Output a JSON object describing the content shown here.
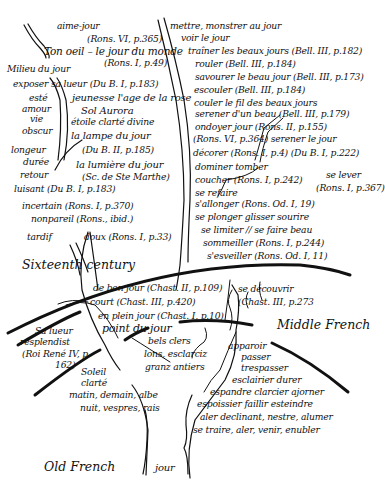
{
  "era_labels": {
    "sixteenth": "Sixteenth century",
    "middle": "Middle French",
    "old": "Old French"
  },
  "root": "jour",
  "sixteenth_left": [
    "aime-jour",
    "(Rons. VI, p.365)",
    "Ton oeil – le jour du monde",
    "(Rons. I, p.49)",
    "Milieu du jour",
    "exposer sa lueur (Du B. I, p.183)",
    "esté",
    "amour",
    "vie",
    "obscur",
    "longeur",
    "durée",
    "retour",
    "luisant (Du B. I, p.183)",
    "incertain (Rons. I, p.370)",
    "nonpareil (Rons., ibid.)",
    "tardif",
    "doux (Rons. I, p.33)"
  ],
  "sixteenth_center": [
    "jeunesse  l'age de la rose",
    "Sol    Aurora",
    "étoile  clarté divine",
    "la lampe du jour",
    "(Du B. II, p.185)",
    "la lumière du jour",
    "(Sc. de Ste Marthe)"
  ],
  "sixteenth_right": [
    "mettre, monstrer au jour",
    "voir le jour",
    "traîner les beaux jours (Bell. III, p.182)",
    "rouler (Bell. III, p.184)",
    "savourer le beau jour (Bell. III, p.173)",
    "escouler (Bell. III, p.184)",
    "couler le fil des beaux jours",
    "serener d'un beau        (Bell. III, p.179)",
    "ondoyer          jour (Rons. II, p.155)",
    "(Rons. VI, p.364)   serener le jour",
    "décorer (Rons. I, p.4)  (Du B. I, p.222)",
    "dominer tomber",
    "coucher (Rons. I, p.242)",
    "se refaire",
    "s'allonger (Rons. Od. I, 19)",
    "se plonger glisser sourire",
    "se limiter // se faire beau",
    "sommeiller (Rons. I, p.244)",
    "s'esveiller (Rons. Od. I, 11)"
  ],
  "se_lever": [
    "se lever",
    "(Rons. I, p.367)"
  ],
  "middle_center": [
    "de bon jour (Chast. II, p.109)",
    "court (Chast. III, p.420)",
    "en plein jour (Chast. I, p.10)",
    "point du jour"
  ],
  "middle_right": [
    "se découvrir",
    "(Chast. III, p.273"
  ],
  "middle_left": [
    "Sa lueur",
    "resplendist",
    "(Roi René IV, p.",
    "162)"
  ],
  "old_center_upper": [
    "bels clers",
    "lons, esclarciz",
    "granz antiers"
  ],
  "old_left": [
    "Soleil",
    "clarté",
    "matin, demain, albe",
    "nuit, vespres, rais"
  ],
  "old_right": [
    "apparoir",
    "passer",
    "trespasser",
    "esclairier durer",
    "espandre clarcier ajorner",
    "espoissier faillir esteindre",
    "aler declinant, nestre, alumer",
    "se traire, aler, venir, enubler"
  ],
  "colors": {
    "ink": "#111111",
    "paper": "#ffffff"
  }
}
